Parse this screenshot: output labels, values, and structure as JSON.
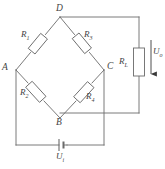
{
  "figure": {
    "type": "circuit-schematic",
    "stroke_color": "#6b6b6b",
    "label_color": "#444444",
    "background_color": "#ffffff"
  },
  "nodes": [
    {
      "id": "A",
      "label": "A",
      "position": "left"
    },
    {
      "id": "B",
      "label": "B",
      "position": "bottom"
    },
    {
      "id": "C",
      "label": "C",
      "position": "right"
    },
    {
      "id": "D",
      "label": "D",
      "position": "top"
    }
  ],
  "resistors": [
    {
      "id": "R1",
      "name": "R",
      "sub": "1",
      "between": "A-D"
    },
    {
      "id": "R2",
      "name": "R",
      "sub": "2",
      "between": "A-B"
    },
    {
      "id": "R3",
      "name": "R",
      "sub": "3",
      "between": "D-C"
    },
    {
      "id": "R4",
      "name": "R",
      "sub": "4",
      "between": "B-C"
    },
    {
      "id": "RL",
      "name": "R",
      "sub": "L",
      "between": "D-B (load branch)"
    }
  ],
  "sources": [
    {
      "id": "Ui",
      "name": "U",
      "sub": "i",
      "type": "battery",
      "between": "A-C"
    }
  ],
  "measurements": [
    {
      "id": "Uo",
      "name": "U",
      "sub": "o",
      "type": "output-voltage",
      "arrow": "down"
    }
  ]
}
